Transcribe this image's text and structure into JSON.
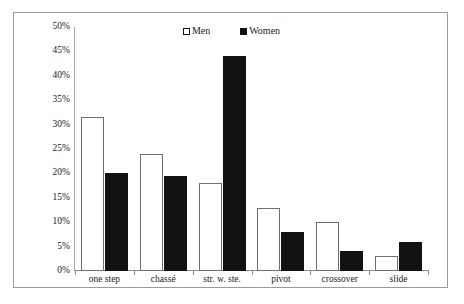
{
  "chart_data": {
    "type": "bar",
    "title": "",
    "subtitle": "",
    "xlabel": "",
    "ylabel": "",
    "categories": [
      "one step",
      "chassé",
      "str. w. ste.",
      "pivot",
      "crossover",
      "slide"
    ],
    "series": [
      {
        "name": "Men",
        "values": [
          31.5,
          24,
          18,
          13,
          10,
          3
        ]
      },
      {
        "name": "Women",
        "values": [
          20,
          19.5,
          44,
          8,
          4,
          6
        ]
      }
    ],
    "ylim": [
      0,
      50
    ],
    "ytick_step": 5,
    "ytick_labels": [
      "50%",
      "45%",
      "40%",
      "35%",
      "30%",
      "25%",
      "20%",
      "15%",
      "10%",
      "5%",
      "0%"
    ],
    "ytick_values": [
      50,
      45,
      40,
      35,
      30,
      25,
      20,
      15,
      10,
      5,
      0
    ],
    "grid": false,
    "legend_position": "top-center",
    "legend": [
      {
        "label": "Men",
        "marker": "open-square",
        "color": "#ffffff"
      },
      {
        "label": "Women",
        "marker": "filled-square",
        "color": "#121212"
      }
    ],
    "value_suffix": "%"
  }
}
